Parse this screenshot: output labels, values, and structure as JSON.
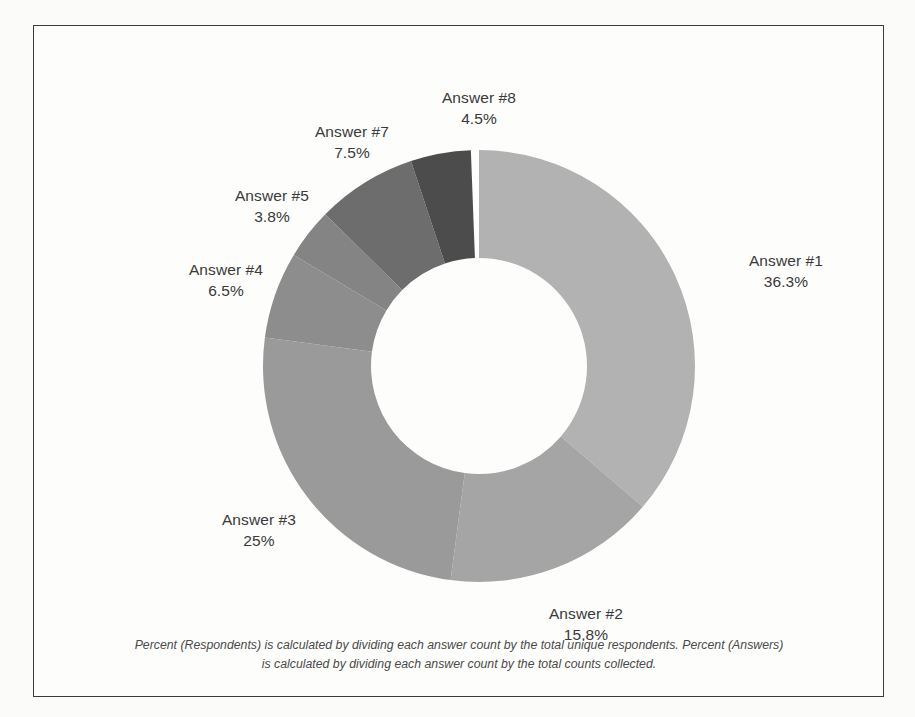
{
  "chart_data": {
    "type": "pie",
    "variant": "donut",
    "title": "",
    "xlabel": "",
    "ylabel": "",
    "legend_position": "none",
    "grid": false,
    "label_format": "name + percent",
    "categories": [
      "Answer #1",
      "Answer #2",
      "Answer #3",
      "Answer #4",
      "Answer #5",
      "Answer #7",
      "Answer #8"
    ],
    "values": [
      36.3,
      15.8,
      25,
      6.5,
      3.8,
      7.5,
      4.5
    ],
    "value_labels": [
      "36.3%",
      "15.8%",
      "25%",
      "6.5%",
      "3.8%",
      "7.5%",
      "4.5%"
    ],
    "unit": "%",
    "start_angle_deg": 0,
    "direction": "clockwise",
    "slices": [
      {
        "name": "Answer #1",
        "value": 36.3,
        "value_label": "36.3%",
        "color": "#b2b2b2",
        "start_deg": 0,
        "sweep_deg": 130.68,
        "label_x": 752,
        "label_y": 225
      },
      {
        "name": "Answer #2",
        "value": 15.8,
        "value_label": "15.8%",
        "color": "#a5a5a5",
        "start_deg": 130.68,
        "sweep_deg": 56.88,
        "label_x": 552,
        "label_y": 578
      },
      {
        "name": "Answer #3",
        "value": 25,
        "value_label": "25%",
        "color": "#9a9a9a",
        "start_deg": 187.56,
        "sweep_deg": 90.0,
        "label_x": 225,
        "label_y": 484
      },
      {
        "name": "Answer #4",
        "value": 6.5,
        "value_label": "6.5%",
        "color": "#8d8d8d",
        "start_deg": 277.56,
        "sweep_deg": 23.4,
        "label_x": 192,
        "label_y": 234
      },
      {
        "name": "Answer #5",
        "value": 3.8,
        "value_label": "3.8%",
        "color": "#848484",
        "start_deg": 300.96,
        "sweep_deg": 13.68,
        "label_x": 238,
        "label_y": 160
      },
      {
        "name": "Answer #7",
        "value": 7.5,
        "value_label": "7.5%",
        "color": "#6d6d6d",
        "start_deg": 314.64,
        "sweep_deg": 27.0,
        "label_x": 318,
        "label_y": 96
      },
      {
        "name": "Answer #8",
        "value": 4.5,
        "value_label": "4.5%",
        "color": "#4c4c4c",
        "start_deg": 341.64,
        "sweep_deg": 16.2,
        "label_x": 445,
        "label_y": 62
      }
    ],
    "geometry": {
      "center_x": 445,
      "center_y": 340,
      "outer_radius": 216,
      "inner_radius": 108
    },
    "footnote": "Percent (Respondents) is calculated by dividing each answer count by the total unique respondents. Percent (Answers) is calculated by dividing each answer count by the total counts collected."
  },
  "style": {
    "border_color": "#3b3b3b",
    "background": "#fdfdfc",
    "label_color": "#3a3a3a",
    "footnote_color": "#4a4a4a"
  }
}
